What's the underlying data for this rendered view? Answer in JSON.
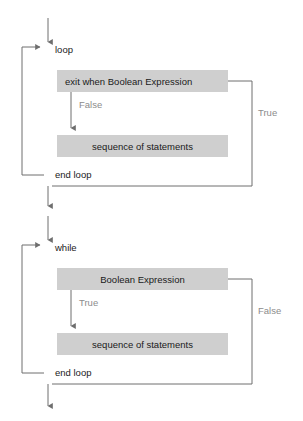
{
  "diagram": {
    "colors": {
      "box_fill": "#cfcfcf",
      "line": "#6e6e6e",
      "text": "#1a1a1a",
      "branch_label": "#8c8c8c",
      "background": "#ffffff"
    },
    "flowcharts": [
      {
        "id": "exit-when-loop",
        "keyword_start": "loop",
        "keyword_end": "end loop",
        "condition_box": "exit when Boolean Expression",
        "body_box": "sequence of statements",
        "branch_inner": "False",
        "branch_outer": "True"
      },
      {
        "id": "while-loop",
        "keyword_start": "while",
        "keyword_end": "end loop",
        "condition_box": "Boolean Expression",
        "body_box": "sequence of statements",
        "branch_inner": "True",
        "branch_outer": "False"
      }
    ]
  }
}
